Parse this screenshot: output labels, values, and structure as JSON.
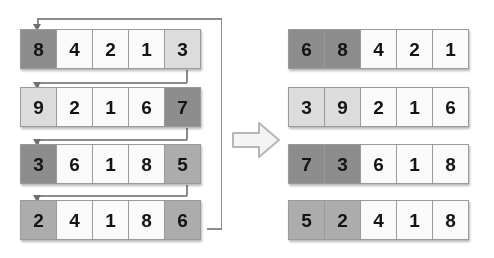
{
  "figure": {
    "title": "Array rotation by one position",
    "transform_arrow": "right-block-arrow"
  },
  "left": {
    "caption": "before",
    "rows": [
      {
        "name": "row-1",
        "cells": [
          {
            "value": "8",
            "shade": "dark"
          },
          {
            "value": "4",
            "shade": "white"
          },
          {
            "value": "2",
            "shade": "white"
          },
          {
            "value": "1",
            "shade": "white"
          },
          {
            "value": "3",
            "shade": "light"
          }
        ]
      },
      {
        "name": "row-2",
        "cells": [
          {
            "value": "9",
            "shade": "light"
          },
          {
            "value": "2",
            "shade": "white"
          },
          {
            "value": "1",
            "shade": "white"
          },
          {
            "value": "6",
            "shade": "white"
          },
          {
            "value": "7",
            "shade": "dark"
          }
        ]
      },
      {
        "name": "row-3",
        "cells": [
          {
            "value": "3",
            "shade": "dark"
          },
          {
            "value": "6",
            "shade": "white"
          },
          {
            "value": "1",
            "shade": "white"
          },
          {
            "value": "8",
            "shade": "white"
          },
          {
            "value": "5",
            "shade": "med"
          }
        ]
      },
      {
        "name": "row-4",
        "cells": [
          {
            "value": "2",
            "shade": "med"
          },
          {
            "value": "4",
            "shade": "white"
          },
          {
            "value": "1",
            "shade": "white"
          },
          {
            "value": "8",
            "shade": "white"
          },
          {
            "value": "6",
            "shade": "med"
          }
        ]
      }
    ]
  },
  "right": {
    "caption": "after",
    "rows": [
      {
        "name": "row-1",
        "cells": [
          {
            "value": "6",
            "shade": "dark"
          },
          {
            "value": "8",
            "shade": "dark"
          },
          {
            "value": "4",
            "shade": "white"
          },
          {
            "value": "2",
            "shade": "white"
          },
          {
            "value": "1",
            "shade": "white"
          }
        ]
      },
      {
        "name": "row-2",
        "cells": [
          {
            "value": "3",
            "shade": "light"
          },
          {
            "value": "9",
            "shade": "light"
          },
          {
            "value": "2",
            "shade": "white"
          },
          {
            "value": "1",
            "shade": "white"
          },
          {
            "value": "6",
            "shade": "white"
          }
        ]
      },
      {
        "name": "row-3",
        "cells": [
          {
            "value": "7",
            "shade": "dark"
          },
          {
            "value": "3",
            "shade": "dark"
          },
          {
            "value": "6",
            "shade": "white"
          },
          {
            "value": "1",
            "shade": "white"
          },
          {
            "value": "8",
            "shade": "white"
          }
        ]
      },
      {
        "name": "row-4",
        "cells": [
          {
            "value": "5",
            "shade": "med"
          },
          {
            "value": "2",
            "shade": "med"
          },
          {
            "value": "4",
            "shade": "white"
          },
          {
            "value": "1",
            "shade": "white"
          },
          {
            "value": "8",
            "shade": "white"
          }
        ]
      }
    ]
  },
  "colors": {
    "white": "#fafafa",
    "light": "#dcdcdc",
    "med": "#acacac",
    "dark": "#8d8d8d",
    "border": "#9a9a9a",
    "connector": "#8c8c8c",
    "background": "#ffffff"
  }
}
